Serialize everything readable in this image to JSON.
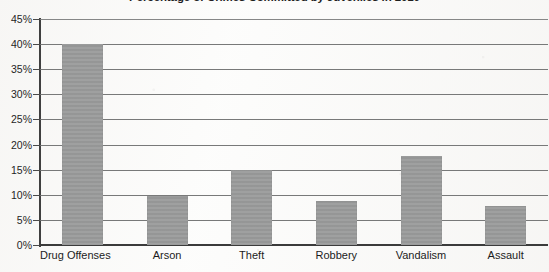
{
  "chart_data": {
    "type": "bar",
    "title": "Percentage of Crimes Committed by Juveniles in 2010",
    "xlabel": "",
    "ylabel": "",
    "categories": [
      "Drug Offenses",
      "Arson",
      "Theft",
      "Robbery",
      "Vandalism",
      "Assault"
    ],
    "values": [
      40.0,
      9.8,
      15.0,
      8.7,
      17.8,
      7.8
    ],
    "ylim": [
      0,
      45
    ],
    "ytick_labels": [
      "0%",
      "5%",
      "10%",
      "15%",
      "20%",
      "25%",
      "30%",
      "35%",
      "40%",
      "45%"
    ],
    "ytick_values": [
      0,
      5,
      10,
      15,
      20,
      25,
      30,
      35,
      40,
      45
    ],
    "grid": true,
    "legend": null,
    "bar_color": "#9a9b9b",
    "gridline_color": "#6d6e6e",
    "axis_color": "#3f3f3f",
    "text_color": "#1f1f1f"
  }
}
